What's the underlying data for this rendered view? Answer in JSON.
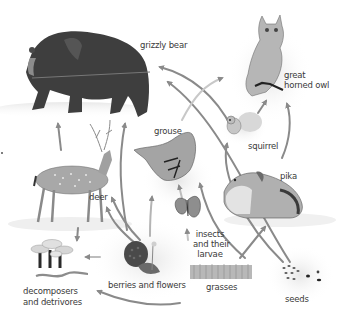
{
  "diagram": {
    "type": "food web",
    "color_mode": "grayscale",
    "colors": {
      "background": "#ffffff",
      "arrow": "#8a8a8a",
      "label_text": "#3a3a3a",
      "bear": "#3c3c3c",
      "halo": "#ececec"
    },
    "organisms": [
      {
        "id": "grizzly_bear",
        "label": "grizzly bear"
      },
      {
        "id": "great_horned_owl",
        "label_line1": "great",
        "label_line2": "horned owl"
      },
      {
        "id": "grouse",
        "label": "grouse"
      },
      {
        "id": "squirrel",
        "label": "squirrel"
      },
      {
        "id": "pika",
        "label": "pika"
      },
      {
        "id": "deer",
        "label": "deer"
      },
      {
        "id": "insects",
        "label_line1": "insects",
        "label_line2": "and their",
        "label_line3": "larvae"
      },
      {
        "id": "decomposers",
        "label_line1": "decomposers",
        "label_line2": "and detrivores"
      },
      {
        "id": "berries",
        "label": "berries and flowers"
      },
      {
        "id": "grasses",
        "label": "grasses"
      },
      {
        "id": "seeds",
        "label": "seeds"
      }
    ],
    "arrows": [
      {
        "from": "deer",
        "to": "grizzly_bear"
      },
      {
        "from": "grouse",
        "to": "grizzly_bear"
      },
      {
        "from": "squirrel",
        "to": "grizzly_bear"
      },
      {
        "from": "seeds",
        "to": "grizzly_bear"
      },
      {
        "from": "grouse",
        "to": "great_horned_owl"
      },
      {
        "from": "squirrel",
        "to": "great_horned_owl"
      },
      {
        "from": "pika",
        "to": "great_horned_owl"
      },
      {
        "from": "seeds",
        "to": "squirrel"
      },
      {
        "from": "grasses",
        "to": "pika"
      },
      {
        "from": "insects",
        "to": "grouse"
      },
      {
        "from": "berries",
        "to": "grouse"
      },
      {
        "from": "berries",
        "to": "deer"
      },
      {
        "from": "grasses",
        "to": "deer"
      },
      {
        "from": "deer",
        "to": "decomposers"
      },
      {
        "from": "berries",
        "to": "decomposers"
      },
      {
        "from": "seeds",
        "to": "decomposers"
      },
      {
        "from": "grasses",
        "to": "insects"
      }
    ]
  }
}
